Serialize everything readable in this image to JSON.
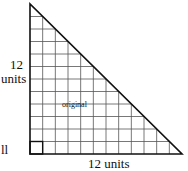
{
  "diagram": {
    "title": "",
    "shape": "right-triangle",
    "grid_cells": 12,
    "labels": {
      "height_value": "12",
      "height_unit": "units",
      "base": "12 units",
      "center": "original",
      "cutoff_left": "ll"
    },
    "colors": {
      "line": "#111111",
      "grid": "#555555"
    }
  }
}
